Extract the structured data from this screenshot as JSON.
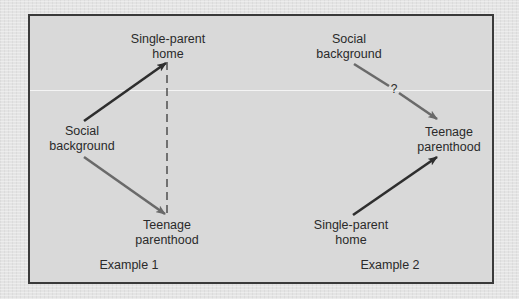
{
  "diagram": {
    "type": "causal-path-diagram",
    "colors": {
      "background": "#e4e4e4",
      "panel": "#d9d9d9",
      "border": "#3a3a3a",
      "arrow_dark": "#2e2e2e",
      "arrow_gray": "#6a6a6a",
      "text": "#2a2a2a"
    },
    "example1": {
      "caption": "Example 1",
      "nodes": {
        "single_parent": {
          "line1": "Single-parent",
          "line2": "home"
        },
        "social": {
          "line1": "Social",
          "line2": "background"
        },
        "teen": {
          "line1": "Teenage",
          "line2": "parenthood"
        }
      },
      "edges": [
        {
          "from": "Social background",
          "to": "Single-parent home",
          "style": "solid-dark"
        },
        {
          "from": "Social background",
          "to": "Teenage parenthood",
          "style": "solid-gray"
        },
        {
          "from": "Single-parent home",
          "to": "Teenage parenthood",
          "style": "dashed"
        }
      ]
    },
    "example2": {
      "caption": "Example 2",
      "question_mark": "?",
      "nodes": {
        "social": {
          "line1": "Social",
          "line2": "background"
        },
        "teen": {
          "line1": "Teenage",
          "line2": "parenthood"
        },
        "single_parent": {
          "line1": "Single-parent",
          "line2": "home"
        }
      },
      "edges": [
        {
          "from": "Social background",
          "to": "Teenage parenthood",
          "style": "solid-gray",
          "label": "?"
        },
        {
          "from": "Single-parent home",
          "to": "Teenage parenthood",
          "style": "solid-dark"
        }
      ]
    }
  }
}
